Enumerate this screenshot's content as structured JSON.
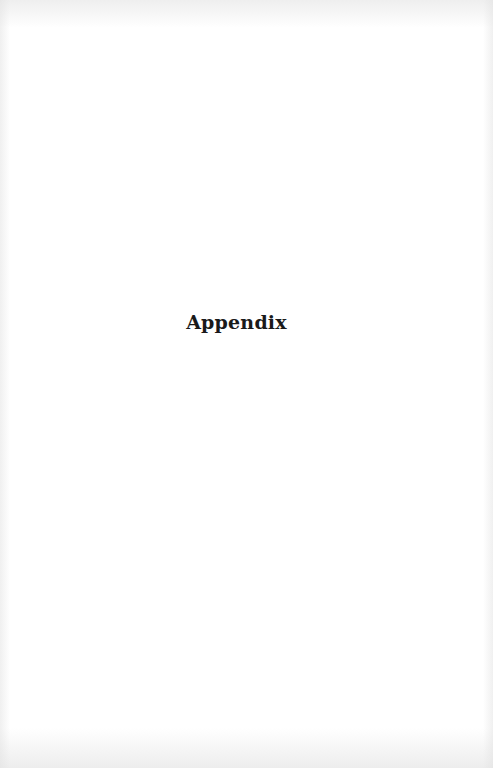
{
  "page": {
    "heading": "Appendix",
    "text_color": "#1a1a1a",
    "background_color": "#ffffff"
  }
}
